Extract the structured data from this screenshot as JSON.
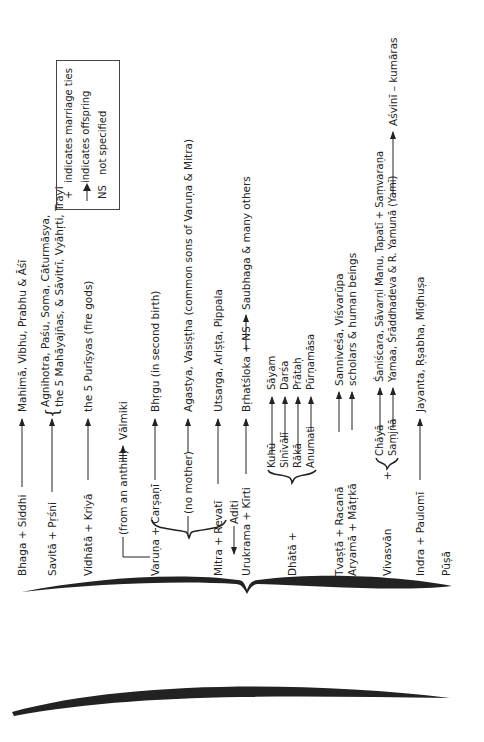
{
  "legend": {
    "plus_symbol": "+",
    "plus_label": "indicates marriage ties",
    "arrow_label": "indicates offspring",
    "ns_symbol": "NS",
    "ns_label": "not specified"
  },
  "root": {
    "label": "Aditi"
  },
  "rows": {
    "bhaga": {
      "parents": "Bhaga + Siddhi",
      "offspring": "Mahimā, Vibhu, Prabhu & Āśī"
    },
    "savita": {
      "parents": "Savitā + Pṛśni",
      "offspring_line1": "Agnihotra, Paśu, Soma, Cāturmāsya,",
      "offspring_line2": "the 5 Mahāyajñas, & Sāvitrī, Vyāhṛti, Trayi"
    },
    "vidhata": {
      "parents": "Vidhātā + Kriyā",
      "offspring": "the 5 Purīṣyas (fire gods)"
    },
    "anthill": {
      "note": "(from an anthill)",
      "offspring": "Vālmiki"
    },
    "varuna": {
      "parents": "Varuṇa + Carṣaṇī",
      "offspring": "Bhṛgu  (in second birth)"
    },
    "no_mother": {
      "note": "(no mother)",
      "offspring": "Agastya, Vasiṣṭha (common sons of Varuṇa & Mitra)"
    },
    "mitra": {
      "parents": "Mitra + Revatī",
      "offspring": "Utsarga, Ariṣṭa, Pippala"
    },
    "urukrama": {
      "parents": "Urukrama + Kīrti",
      "offspring": "Bṛhatśloka + NS",
      "grand_offspring": "Saubhaga & many others"
    },
    "dhata": {
      "name": "Dhātā +",
      "wives": [
        "Kuhū",
        "Sinīvālī",
        "Rākā",
        "Anumati"
      ],
      "offspring": [
        "Sāyam",
        "Darśa",
        "Prātaḥ",
        "Pūrṇamāsa"
      ]
    },
    "tvasta": {
      "parents": "Tvaṣṭā + Racanā",
      "offspring": "Sanniveśa, Viśvarūpa"
    },
    "aryama": {
      "parents": "Aryamā + Mātṛkā",
      "offspring": "scholars & human beings"
    },
    "vivasvan": {
      "name": "Vivasvān",
      "plus": "+",
      "wives": [
        "Chāyā",
        "Saṃjñā"
      ],
      "offspring": [
        "Śaniścara, Sāvarṇi Manu, Tapatī + Saṃvaraṇa",
        "Yamaa, Śrāddhadeva & R. Yamunā (Yamī)"
      ],
      "extra_offspring": "Aśvinī – kumāras"
    },
    "indra": {
      "parents": "Indra + Paulomī",
      "offspring": "Jayanta, Ṛṣabha, Mīḍhuṣa"
    },
    "pusa": {
      "name": "Pūṣā"
    }
  }
}
